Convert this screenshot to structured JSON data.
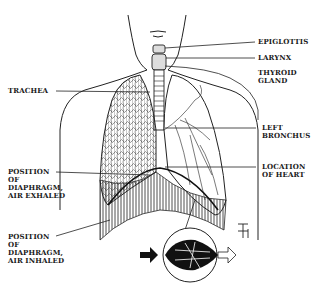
{
  "diagram": {
    "labels": {
      "epiglottis": "EPIGLOTTIS",
      "larynx": "LARYNX",
      "thyroid_gland": "THYROID\nGLAND",
      "trachea": "TRACHEA",
      "left_bronchus": "LEFT\nBRONCHUS",
      "location_of_heart": "LOCATION\nOF HEART",
      "diaphragm_exhaled": "POSITION\nOF\nDIAPHRAGM,\nAIR EXHALED",
      "diaphragm_inhaled": "POSITION\nOF\nDIAPHRAGM,\nAIR INHALED"
    },
    "inset": {
      "subject": "alveolus detail with air flow arrows",
      "arrow_in": "filled-arrow-right",
      "arrow_out": "outline-arrow-right"
    },
    "signature": "artist monogram"
  }
}
